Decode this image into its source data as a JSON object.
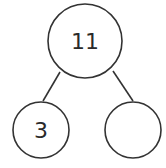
{
  "diagram": {
    "type": "number-bond",
    "whole": {
      "value": "11"
    },
    "parts": [
      {
        "value": "3"
      },
      {
        "value": ""
      }
    ],
    "stroke_color": "#333333",
    "background": "#ffffff"
  }
}
